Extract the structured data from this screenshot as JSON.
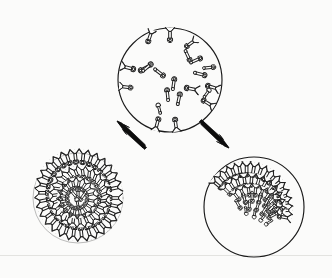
{
  "figure": {
    "background_color": "#fbfbfa",
    "ink_color": "#1d1d1d",
    "width": 332,
    "height": 278,
    "baseline_y": 255,
    "baseline_color": "#e3e3e0"
  },
  "panels": [
    {
      "id": "source-vesicle",
      "label": "Vesicle with dispersed spikes",
      "shape": "circle",
      "cx": 170,
      "cy": 80,
      "r": 52,
      "spike_distribution": "dispersed",
      "interior_spike_count": 11,
      "rim_spike_count": 8
    },
    {
      "id": "uniform-particle",
      "label": "Particle with uniformly distributed spikes",
      "shape": "circle",
      "cx": 78,
      "cy": 198,
      "r": 45,
      "spike_distribution": "uniform",
      "spike_count": 86
    },
    {
      "id": "capped-particle",
      "label": "Particle with capped spike cluster",
      "shape": "circle",
      "cx": 254,
      "cy": 207,
      "r": 50,
      "spike_distribution": "capped",
      "spike_count": 54,
      "cap_arc_degrees": 150
    }
  ],
  "arrows": [
    {
      "id": "arrow-to-uniform",
      "from_panel": "source-vesicle",
      "to_panel": "uniform-particle",
      "x1": 143,
      "y1": 147,
      "x2": 116,
      "y2": 122,
      "direction": "up-right",
      "color": "#0d0d0d"
    },
    {
      "id": "arrow-to-capped",
      "from_panel": "source-vesicle",
      "to_panel": "capped-particle",
      "x1": 203,
      "y1": 122,
      "x2": 230,
      "y2": 147,
      "direction": "down-right",
      "color": "#0d0d0d"
    }
  ],
  "spike_glyph": {
    "description": "Y-shaped trimeric spike: splayed tripod foot, narrow stalk, bulbous head",
    "head_shape": "rounded-lobe",
    "stalk": "narrow-rod",
    "foot": "three-pronged"
  }
}
